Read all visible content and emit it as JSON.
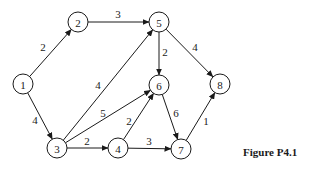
{
  "figure": {
    "caption": "Figure P4.1"
  },
  "graph": {
    "directed": true,
    "node_radius": 10,
    "nodes": [
      {
        "id": "1",
        "label": "1",
        "x": 23,
        "y": 84
      },
      {
        "id": "2",
        "label": "2",
        "x": 78,
        "y": 22
      },
      {
        "id": "3",
        "label": "3",
        "x": 57,
        "y": 148
      },
      {
        "id": "4",
        "label": "4",
        "x": 118,
        "y": 148
      },
      {
        "id": "5",
        "label": "5",
        "x": 159,
        "y": 22
      },
      {
        "id": "6",
        "label": "6",
        "x": 159,
        "y": 85
      },
      {
        "id": "7",
        "label": "7",
        "x": 181,
        "y": 149
      },
      {
        "id": "8",
        "label": "8",
        "x": 220,
        "y": 84
      }
    ],
    "edges": [
      {
        "from": "1",
        "to": "2",
        "weight": "2",
        "lx": 43,
        "ly": 47
      },
      {
        "from": "1",
        "to": "3",
        "weight": "4",
        "lx": 35,
        "ly": 120
      },
      {
        "from": "2",
        "to": "5",
        "weight": "3",
        "lx": 118,
        "ly": 14
      },
      {
        "from": "3",
        "to": "5",
        "weight": "4",
        "lx": 98,
        "ly": 85
      },
      {
        "from": "3",
        "to": "6",
        "weight": "5",
        "lx": 103,
        "ly": 113
      },
      {
        "from": "3",
        "to": "4",
        "weight": "2",
        "lx": 87,
        "ly": 141
      },
      {
        "from": "4",
        "to": "6",
        "weight": "2",
        "lx": 129,
        "ly": 121
      },
      {
        "from": "4",
        "to": "7",
        "weight": "3",
        "lx": 149,
        "ly": 141
      },
      {
        "from": "5",
        "to": "6",
        "weight": "2",
        "lx": 165,
        "ly": 52
      },
      {
        "from": "5",
        "to": "8",
        "weight": "4",
        "lx": 195,
        "ly": 47
      },
      {
        "from": "6",
        "to": "7",
        "weight": "6",
        "lx": 176,
        "ly": 113
      },
      {
        "from": "7",
        "to": "8",
        "weight": "1",
        "lx": 206,
        "ly": 121
      }
    ]
  }
}
